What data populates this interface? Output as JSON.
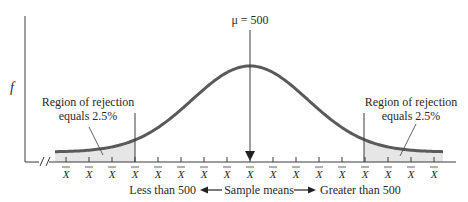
{
  "diagram": {
    "y_axis_label": "f",
    "mean_label": "μ = 500",
    "tick_label": "X",
    "tick_count": 17,
    "left_region": {
      "line1": "Region of rejection",
      "line2": "equals 2.5%"
    },
    "right_region": {
      "line1": "Region of rejection",
      "line2": "equals 2.5%"
    },
    "bottom": {
      "left_text": "Less than 500",
      "center_text": "Sample means",
      "right_text": "Greater than 500"
    },
    "colors": {
      "curve": "#5a5a5a",
      "axis": "#3a3a3a",
      "shade": "#e4e4e4",
      "text": "#2a2a2a"
    }
  }
}
